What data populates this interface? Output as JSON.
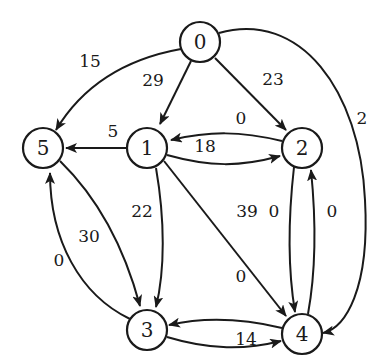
{
  "graph": {
    "type": "directed-weighted-graph",
    "nodes": [
      {
        "id": "0",
        "label": "0",
        "x": 200,
        "y": 42
      },
      {
        "id": "1",
        "label": "1",
        "x": 147,
        "y": 148
      },
      {
        "id": "2",
        "label": "2",
        "x": 302,
        "y": 148
      },
      {
        "id": "3",
        "label": "3",
        "x": 147,
        "y": 330
      },
      {
        "id": "4",
        "label": "4",
        "x": 302,
        "y": 334
      },
      {
        "id": "5",
        "label": "5",
        "x": 43,
        "y": 148
      }
    ],
    "edges": [
      {
        "from": "0",
        "to": "5",
        "weight": "15"
      },
      {
        "from": "0",
        "to": "1",
        "weight": "29"
      },
      {
        "from": "0",
        "to": "2",
        "weight": "23"
      },
      {
        "from": "0",
        "to": "4",
        "weight": "2"
      },
      {
        "from": "1",
        "to": "5",
        "weight": "5"
      },
      {
        "from": "2",
        "to": "1",
        "weight": "0"
      },
      {
        "from": "1",
        "to": "2",
        "weight": "18"
      },
      {
        "from": "1",
        "to": "3",
        "weight": "22"
      },
      {
        "from": "1",
        "to": "4",
        "weight": "39"
      },
      {
        "from": "5",
        "to": "3",
        "weight": "30"
      },
      {
        "from": "3",
        "to": "5",
        "weight": "0"
      },
      {
        "from": "2",
        "to": "4",
        "weight": "0"
      },
      {
        "from": "4",
        "to": "2",
        "weight": "0"
      },
      {
        "from": "4",
        "to": "3",
        "weight": "0"
      },
      {
        "from": "3",
        "to": "4",
        "weight": "14"
      }
    ]
  },
  "labels": {
    "n0": "0",
    "n1": "1",
    "n2": "2",
    "n3": "3",
    "n4": "4",
    "n5": "5",
    "e_0_5": "15",
    "e_0_1": "29",
    "e_0_2": "23",
    "e_0_4": "2",
    "e_1_5": "5",
    "e_2_1": "0",
    "e_1_2": "18",
    "e_1_3": "22",
    "e_1_4": "39",
    "e_5_3": "30",
    "e_3_5": "0",
    "e_2_4": "0",
    "e_4_2": "0",
    "e_4_3": "0",
    "e_3_4": "14"
  },
  "colors": {
    "stroke": "#1a1a1a",
    "background": "#ffffff"
  }
}
